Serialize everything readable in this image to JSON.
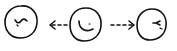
{
  "diagram": {
    "type": "sketch",
    "stroke_color": "#111111",
    "background": "#ffffff",
    "nodes": [
      {
        "id": "left-face",
        "expression": "smirk-wavy",
        "cx": 21,
        "cy": 22,
        "r": 16
      },
      {
        "id": "center-face",
        "expression": "smile",
        "cx": 85,
        "cy": 25,
        "r": 16
      },
      {
        "id": "right-face",
        "expression": "frown-v",
        "cx": 151,
        "cy": 25,
        "r": 15
      }
    ],
    "edges": [
      {
        "from": "center-face",
        "to": "left-face",
        "style": "dashed",
        "direction": "left"
      },
      {
        "from": "center-face",
        "to": "right-face",
        "style": "dashed",
        "direction": "right"
      }
    ]
  }
}
